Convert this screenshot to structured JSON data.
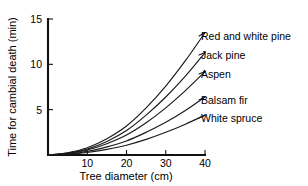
{
  "chart_data": {
    "type": "line",
    "title": "",
    "xlabel": "Tree diameter (cm)",
    "ylabel": "Time for cambial death (min)",
    "xlim": [
      0,
      40
    ],
    "ylim": [
      0,
      15
    ],
    "xticks": [
      10,
      20,
      30,
      40
    ],
    "yticks": [
      5,
      10,
      15
    ],
    "xtick_labels": [
      "10",
      "20",
      "30",
      "40"
    ],
    "ytick_labels": [
      "5",
      "10",
      "15"
    ],
    "grid": false,
    "legend_position": "inline-right-labels",
    "line_color": "#1a1a1a",
    "background_color": "#ffffff",
    "x": [
      0,
      5,
      10,
      15,
      20,
      25,
      30,
      35,
      40
    ],
    "series": [
      {
        "name": "Red and white pine",
        "label": "Red and white pine",
        "values": [
          0.0,
          0.25,
          0.8,
          1.8,
          3.2,
          5.2,
          7.6,
          10.4,
          13.5
        ]
      },
      {
        "name": "Jack pine",
        "label": "Jack pine",
        "values": [
          0.0,
          0.2,
          0.65,
          1.5,
          2.7,
          4.4,
          6.4,
          8.7,
          11.3
        ]
      },
      {
        "name": "Aspen",
        "label": "Aspen",
        "values": [
          0.0,
          0.17,
          0.55,
          1.25,
          2.2,
          3.55,
          5.2,
          7.1,
          9.2
        ]
      },
      {
        "name": "Balsam fir",
        "label": "Balsam fir",
        "values": [
          0.0,
          0.12,
          0.4,
          0.9,
          1.55,
          2.5,
          3.6,
          4.9,
          6.4
        ]
      },
      {
        "name": "White spruce",
        "label": "White spruce",
        "values": [
          0.0,
          0.08,
          0.28,
          0.62,
          1.08,
          1.72,
          2.5,
          3.4,
          4.4
        ]
      }
    ]
  }
}
